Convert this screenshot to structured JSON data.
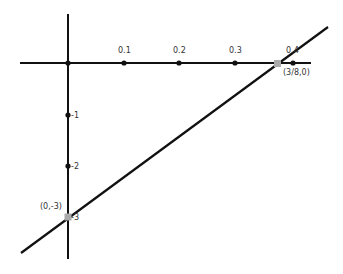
{
  "diagram": {
    "type": "coordinate-graph",
    "x_axis": {
      "ticks": [
        {
          "label": "0.1",
          "value": 0.1
        },
        {
          "label": "0.2",
          "value": 0.2
        },
        {
          "label": "0.3",
          "value": 0.3
        },
        {
          "label": "0.4",
          "value": 0.4
        }
      ]
    },
    "y_axis": {
      "ticks": [
        {
          "label": "-1",
          "value": -1
        },
        {
          "label": "-2",
          "value": -2
        },
        {
          "label": "-3",
          "value": -3
        }
      ]
    },
    "line": {
      "equation": "y = 8x - 3",
      "color": "#111111"
    },
    "points": [
      {
        "label": "(3/8,0)",
        "x": 0.375,
        "y": 0
      },
      {
        "label": "(0,-3)",
        "x": 0,
        "y": -3
      }
    ],
    "colors": {
      "axis": "#111111",
      "tick_dot": "#111111",
      "intercept_point": "#aaaaaa"
    }
  }
}
